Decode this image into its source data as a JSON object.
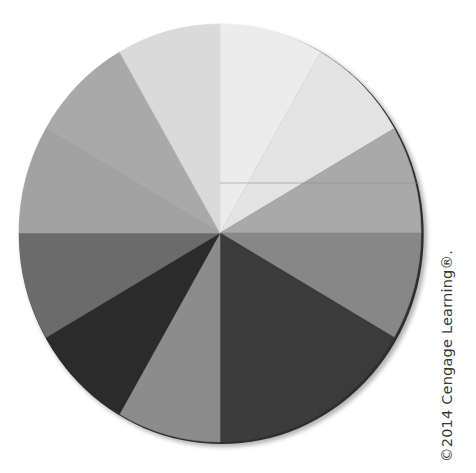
{
  "figure": {
    "type": "value-wheel",
    "center": [
      220,
      233
    ],
    "radius_x": 201,
    "radius_y": 209,
    "start_angle_deg": 0,
    "direction": "clockwise-from-top",
    "rim_color": "#2e2e2e",
    "shadow_color": "#9a9a9a",
    "artifact_line": {
      "y": 183,
      "x1": 220,
      "x2": 419,
      "color": "#8a8a8a"
    },
    "segments": [
      {
        "index": 0,
        "start": 0,
        "end": 30,
        "color": "#ececec"
      },
      {
        "index": 1,
        "start": 30,
        "end": 60,
        "color": "#e3e3e3"
      },
      {
        "index": 2,
        "start": 60,
        "end": 90,
        "color": "#a9a9a9"
      },
      {
        "index": 3,
        "start": 90,
        "end": 120,
        "color": "#878787"
      },
      {
        "index": 4,
        "start": 120,
        "end": 150,
        "color": "#3b3b3b"
      },
      {
        "index": 5,
        "start": 150,
        "end": 180,
        "color": "#3c3c3c"
      },
      {
        "index": 6,
        "start": 180,
        "end": 210,
        "color": "#8c8c8c"
      },
      {
        "index": 7,
        "start": 210,
        "end": 240,
        "color": "#2b2b2b"
      },
      {
        "index": 8,
        "start": 240,
        "end": 270,
        "color": "#6b6b6b"
      },
      {
        "index": 9,
        "start": 270,
        "end": 300,
        "color": "#a2a2a2"
      },
      {
        "index": 10,
        "start": 300,
        "end": 330,
        "color": "#a9a9a9"
      },
      {
        "index": 11,
        "start": 330,
        "end": 360,
        "color": "#dadada"
      }
    ]
  },
  "copyright": {
    "text": "©2014 Cengage Learning®."
  }
}
